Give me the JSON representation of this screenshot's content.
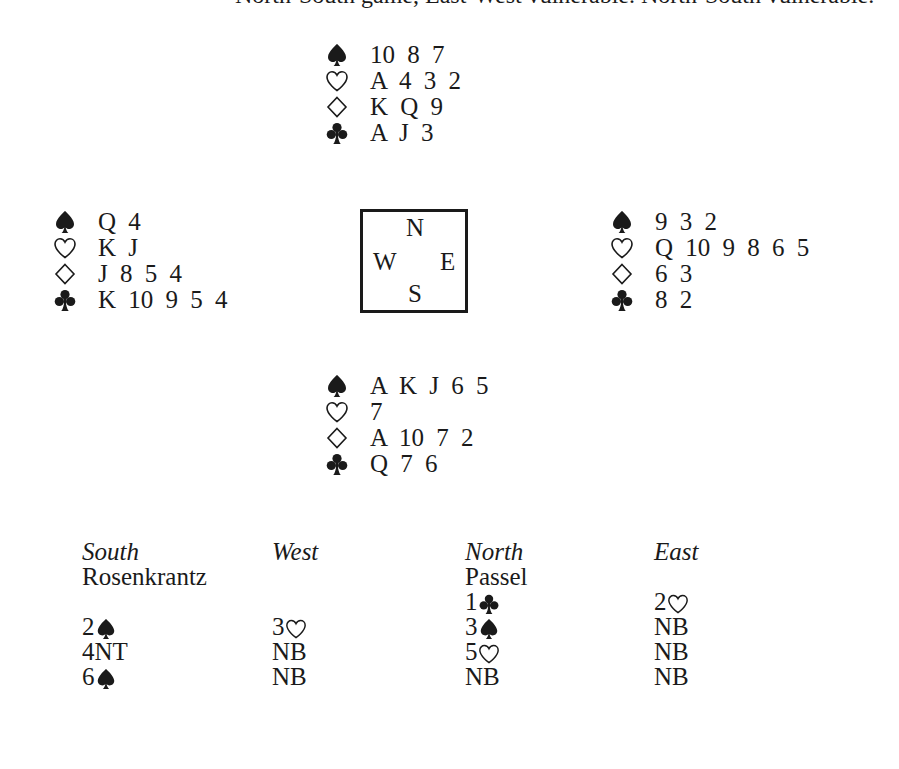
{
  "caption": {
    "text": "North-South game, East-West vulnerable. North-South vulnerable.",
    "note": "Top line of text is cut off; only the bottom edge of glyphs is visible."
  },
  "suit_icons": {
    "spade": "♠",
    "heart": "♡",
    "diamond": "◇",
    "club": "♣"
  },
  "deal": {
    "north": {
      "spades": "10 8 7",
      "hearts": "A 4 3 2",
      "diamonds": "K Q 9",
      "clubs": "A J 3"
    },
    "west": {
      "spades": "Q 4",
      "hearts": "K J",
      "diamonds": "J 8 5 4",
      "clubs": "K 10 9 5 4"
    },
    "east": {
      "spades": "9 3 2",
      "hearts": "Q 10 9 8 6 5",
      "diamonds": "6 3",
      "clubs": "8 2"
    },
    "south": {
      "spades": "A K J 6 5",
      "hearts": "7",
      "diamonds": "A 10 7 2",
      "clubs": "Q 7 6"
    }
  },
  "compass": {
    "n": "N",
    "w": "W",
    "e": "E",
    "s": "S"
  },
  "auction": {
    "headers": [
      "South",
      "West",
      "North",
      "East"
    ],
    "players": [
      "Rosenkrantz",
      "",
      "Passel",
      ""
    ],
    "rows": [
      [
        {
          "level": "",
          "suit": ""
        },
        {
          "level": "",
          "suit": ""
        },
        {
          "level": "1",
          "suit": "club"
        },
        {
          "level": "2",
          "suit": "heart"
        }
      ],
      [
        {
          "level": "2",
          "suit": "spade"
        },
        {
          "level": "3",
          "suit": "heart"
        },
        {
          "level": "3",
          "suit": "spade"
        },
        {
          "level": "NB",
          "suit": ""
        }
      ],
      [
        {
          "level": "4NT",
          "suit": ""
        },
        {
          "level": "NB",
          "suit": ""
        },
        {
          "level": "5",
          "suit": "heart"
        },
        {
          "level": "NB",
          "suit": ""
        }
      ],
      [
        {
          "level": "6",
          "suit": "spade"
        },
        {
          "level": "NB",
          "suit": ""
        },
        {
          "level": "NB",
          "suit": ""
        },
        {
          "level": "NB",
          "suit": ""
        }
      ]
    ]
  }
}
